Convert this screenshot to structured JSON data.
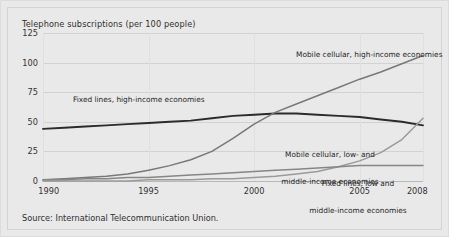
{
  "figure": {
    "title": "Telephone subscriptions (per 100 people)",
    "source": "Source: International Telecommunication Union."
  },
  "chart_data": {
    "type": "line",
    "title": "Telephone subscriptions (per 100 people)",
    "xlabel": "",
    "ylabel": "",
    "xlim": [
      1990,
      2008
    ],
    "ylim": [
      0,
      125
    ],
    "yticks": [
      0,
      25,
      50,
      75,
      100,
      125
    ],
    "xticks": [
      1990,
      1995,
      2000,
      2005,
      2008
    ],
    "grid": true,
    "legend_position": "inline-annotations",
    "x": [
      1990,
      1991,
      1992,
      1993,
      1994,
      1995,
      1996,
      1997,
      1998,
      1999,
      2000,
      2001,
      2002,
      2003,
      2004,
      2005,
      2006,
      2007,
      2008
    ],
    "series": [
      {
        "name": "Fixed lines, high-income economies",
        "color": "#2b2b2b",
        "values": [
          44,
          45,
          46,
          47,
          48,
          49,
          50,
          51,
          53,
          55,
          56,
          57,
          57,
          56,
          55,
          54,
          52,
          50,
          47
        ]
      },
      {
        "name": "Mobile cellular, high-income economies",
        "color": "#787878",
        "values": [
          1,
          2,
          3,
          4,
          6,
          9,
          13,
          18,
          25,
          36,
          48,
          58,
          65,
          72,
          79,
          86,
          92,
          99,
          106
        ]
      },
      {
        "name": "Mobile cellular, low- and middle-income economies",
        "color": "#9a9a9a",
        "values": [
          0,
          0,
          0,
          0,
          0,
          1,
          1,
          1,
          2,
          2,
          3,
          4,
          6,
          8,
          12,
          17,
          24,
          35,
          53
        ]
      },
      {
        "name": "Fixed lines, low and middle-income economies",
        "color": "#868686",
        "values": [
          1,
          1,
          2,
          2,
          3,
          3,
          4,
          5,
          6,
          7,
          8,
          9,
          10,
          11,
          12,
          13,
          13,
          13,
          13
        ]
      }
    ],
    "annotations": [
      {
        "id": "fixed-high",
        "text": "Fixed lines, high-income economies"
      },
      {
        "id": "mobile-high",
        "text": "Mobile cellular, high-income economies"
      },
      {
        "id": "mobile-low-line1",
        "text": "Mobile cellular, low- and"
      },
      {
        "id": "mobile-low-line2",
        "text": "middle-income economies"
      },
      {
        "id": "fixed-low-line1",
        "text": "Fixed lines, low and"
      },
      {
        "id": "fixed-low-line2",
        "text": "middle-income economies"
      }
    ]
  }
}
